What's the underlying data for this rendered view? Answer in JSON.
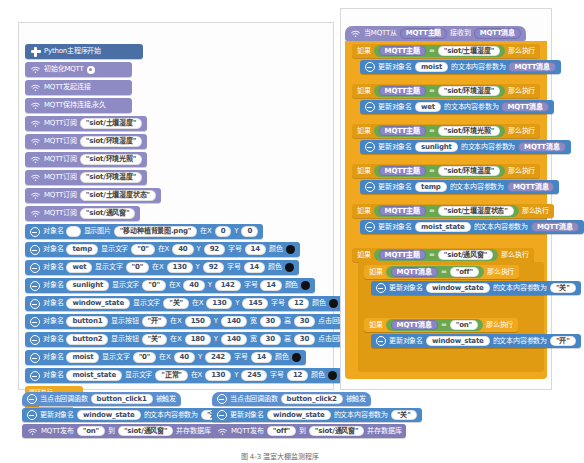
{
  "app": {
    "caption": "图 4-3  温室大棚监测程序"
  },
  "left_program": {
    "start_block": {
      "label": "Python主程序开始",
      "icon": "plus-icon"
    },
    "init_blocks": [
      {
        "label": "初始化MQTT",
        "icon": "wifi-icon",
        "has_gear": true
      },
      {
        "label": "MQTT发起连接",
        "icon": "wifi-icon"
      },
      {
        "label": "MQTT保持连接,永久",
        "icon": "wifi-icon"
      }
    ],
    "subscribe_blocks": [
      {
        "label": "MQTT订阅",
        "icon": "wifi-icon",
        "topic": "\"siot/土壤湿度\""
      },
      {
        "label": "MQTT订阅",
        "icon": "wifi-icon",
        "topic": "\"siot/环境湿度\""
      },
      {
        "label": "MQTT订阅",
        "icon": "wifi-icon",
        "topic": "\"siot/环境光照\""
      },
      {
        "label": "MQTT订阅",
        "icon": "wifi-icon",
        "topic": "\"siot/环境温度\""
      },
      {
        "label": "MQTT订阅",
        "icon": "wifi-icon",
        "topic": "\"siot/土壤湿度状态\""
      },
      {
        "label": "MQTT订阅",
        "icon": "wifi-icon",
        "topic": "\"siot/通风窗\""
      }
    ],
    "image_block": {
      "w1": "对象名",
      "obj": "",
      "w2": "显示图片",
      "file": "\"移动种植背景图.png\"",
      "w3": "在X",
      "x": "0",
      "w4": "Y",
      "y": "0"
    },
    "text_blocks": [
      {
        "w1": "对象名",
        "obj": "temp",
        "w2": "显示文字",
        "text": "\"0\"",
        "w3": "在X",
        "x": "40",
        "w4": "Y",
        "y": "92",
        "w5": "字号",
        "size": "14",
        "w6": "颜色"
      },
      {
        "w1": "对象名",
        "obj": "wet",
        "w2": "显示文字",
        "text": "\"0\"",
        "w3": "在X",
        "x": "130",
        "w4": "Y",
        "y": "92",
        "w5": "字号",
        "size": "14",
        "w6": "颜色"
      },
      {
        "w1": "对象名",
        "obj": "sunlight",
        "w2": "显示文字",
        "text": "\"0\"",
        "w3": "在X",
        "x": "40",
        "w4": "Y",
        "y": "142",
        "w5": "字号",
        "size": "14",
        "w6": "颜色"
      },
      {
        "w1": "对象名",
        "obj": "window_state",
        "w2": "显示文字",
        "text": "\"关\"",
        "w3": "在X",
        "x": "130",
        "w4": "Y",
        "y": "145",
        "w5": "字号",
        "size": "12",
        "w6": "颜色"
      }
    ],
    "button_blocks": [
      {
        "w1": "对象名",
        "obj": "button1",
        "w2": "显示按钮",
        "text": "\"开\"",
        "w3": "在X",
        "x": "150",
        "w4": "Y",
        "y": "140",
        "w5": "宽",
        "width": "30",
        "w6": "高",
        "height": "30",
        "w7": "点击回调函数名",
        "callback": "button_click1"
      },
      {
        "w1": "对象名",
        "obj": "button2",
        "w2": "显示按钮",
        "text": "\"关\"",
        "w3": "在X",
        "x": "180",
        "w4": "Y",
        "y": "140",
        "w5": "宽",
        "width": "30",
        "w6": "高",
        "height": "30",
        "w7": "点击回调函数名",
        "callback": "button_click2"
      }
    ],
    "text_blocks2": [
      {
        "w1": "对象名",
        "obj": "moist",
        "w2": "显示文字",
        "text": "\"0\"",
        "w3": "在X",
        "x": "40",
        "w4": "Y",
        "y": "242",
        "w5": "字号",
        "size": "14",
        "w6": "颜色"
      },
      {
        "w1": "对象名",
        "obj": "moist_state",
        "w2": "显示文字",
        "text": "\"正常\"",
        "w3": "在X",
        "x": "130",
        "w4": "Y",
        "y": "245",
        "w5": "字号",
        "size": "12",
        "w6": "颜色"
      }
    ],
    "loop_block": {
      "label": "循环执行"
    }
  },
  "right_program": {
    "hat": {
      "icon": "wifi-icon",
      "w1": "当MQTT从",
      "slot1": "MQTT主题",
      "w2": "接收到",
      "slot2": "MQTT消息"
    },
    "branches": [
      {
        "if_word": "如果",
        "left": "MQTT主题",
        "op": "=",
        "right": "\"siot/土壤湿度\"",
        "then_word": "那么执行",
        "action": {
          "w1": "更新对象名",
          "obj": "moist",
          "w2": "的文本内容参数为",
          "value": "MQTT消息",
          "value_kind": "mqtt"
        }
      },
      {
        "if_word": "如果",
        "left": "MQTT主题",
        "op": "=",
        "right": "\"siot/环境湿度\"",
        "then_word": "那么执行",
        "action": {
          "w1": "更新对象名",
          "obj": "wet",
          "w2": "的文本内容参数为",
          "value": "MQTT消息",
          "value_kind": "mqtt"
        }
      },
      {
        "if_word": "如果",
        "left": "MQTT主题",
        "op": "=",
        "right": "\"siot/环境光照\"",
        "then_word": "那么执行",
        "action": {
          "w1": "更新对象名",
          "obj": "sunlight",
          "w2": "的文本内容参数为",
          "value": "MQTT消息",
          "value_kind": "mqtt"
        }
      },
      {
        "if_word": "如果",
        "left": "MQTT主题",
        "op": "=",
        "right": "\"siot/环境温度\"",
        "then_word": "那么执行",
        "action": {
          "w1": "更新对象名",
          "obj": "temp",
          "w2": "的文本内容参数为",
          "value": "MQTT消息",
          "value_kind": "mqtt"
        }
      },
      {
        "if_word": "如果",
        "left": "MQTT主题",
        "op": "=",
        "right": "\"siot/土壤湿度状态\"",
        "then_word": "那么执行",
        "action": {
          "w1": "更新对象名",
          "obj": "moist_state",
          "w2": "的文本内容参数为",
          "value": "MQTT消息",
          "value_kind": "mqtt"
        }
      }
    ],
    "window_branch": {
      "if_word": "如果",
      "left": "MQTT主题",
      "op": "=",
      "right": "\"siot/通风窗\"",
      "then_word": "那么执行",
      "inner": [
        {
          "if_word": "如果",
          "left": "MQTT消息",
          "op": "=",
          "right": "\"off\"",
          "then_word": "那么执行",
          "action": {
            "w1": "更新对象名",
            "obj": "window_state",
            "w2": "的文本内容参数为",
            "value": "\"关\"",
            "value_kind": "str"
          }
        },
        {
          "if_word": "如果",
          "left": "MQTT消息",
          "op": "=",
          "right": "\"on\"",
          "then_word": "那么执行",
          "action": {
            "w1": "更新对象名",
            "obj": "window_state",
            "w2": "的文本内容参数为",
            "value": "\"开\"",
            "value_kind": "str"
          }
        }
      ]
    }
  },
  "handlers": [
    {
      "hat": {
        "w1": "当点击回调函数",
        "fn": "button_click1",
        "w2": "被触发"
      },
      "update": {
        "w1": "更新对象名",
        "obj": "window_state",
        "w2": "的文本内容参数为",
        "value": "\"开\""
      },
      "publish": {
        "w1": "MQTT发布",
        "msg": "\"on\"",
        "w2": "到",
        "topic": "\"siot/通风窗\"",
        "w3": "并存数据库"
      }
    },
    {
      "hat": {
        "w1": "当点击回调函数",
        "fn": "button_click2",
        "w2": "被触发"
      },
      "update": {
        "w1": "更新对象名",
        "obj": "window_state",
        "w2": "的文本内容参数为",
        "value": "\"关\""
      },
      "publish": {
        "w1": "MQTT发布",
        "msg": "\"off\"",
        "w2": "到",
        "topic": "\"siot/通风窗\"",
        "w3": "并存数据库"
      }
    }
  ],
  "colors": {
    "mqtt_purple": "#8e8bc4",
    "display_blue": "#4b89c8",
    "control_orange": "#f0a81e",
    "compare_green": "#6aa84f",
    "start_navy": "#4a6fa5"
  }
}
